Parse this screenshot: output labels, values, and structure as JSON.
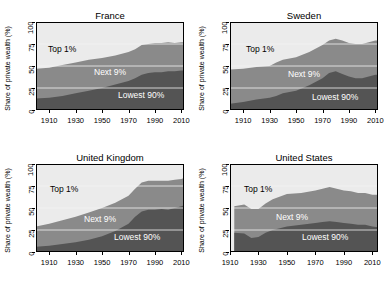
{
  "figure": {
    "ylabel": "Share of private wealth (%)",
    "yticks": [
      0,
      25,
      50,
      75,
      100
    ],
    "xticks": [
      1910,
      1930,
      1950,
      1970,
      1990,
      2010
    ],
    "band_labels": {
      "top": "Top 1%",
      "middle": "Next 9%",
      "bottom": "Lowest 90%"
    },
    "colors": {
      "top_band": "#ebebeb",
      "middle_band": "#8a8a8a",
      "bottom_band": "#545454",
      "gridline": "#f2f2f2",
      "axis": "#000000"
    }
  },
  "chart_data": [
    {
      "type": "area",
      "title": "France",
      "xlabel": "",
      "ylabel": "Share of private wealth (%)",
      "xlim": [
        1900,
        2012
      ],
      "ylim": [
        0,
        100
      ],
      "grid": true,
      "stacked": true,
      "legend_position": "inline-annotations",
      "x": [
        1900,
        1910,
        1920,
        1930,
        1940,
        1950,
        1960,
        1970,
        1975,
        1980,
        1985,
        1990,
        1995,
        2000,
        2005,
        2010,
        2012
      ],
      "series": [
        {
          "name": "Lowest 90%",
          "values": [
            13,
            14,
            16,
            19,
            22,
            25,
            29,
            33,
            36,
            40,
            42,
            43,
            43,
            44,
            44,
            45,
            45
          ]
        },
        {
          "name": "Next 9%",
          "values": [
            34,
            34,
            35,
            35,
            35,
            34,
            33,
            33,
            33,
            34,
            33,
            33,
            33,
            33,
            32,
            32,
            32
          ]
        },
        {
          "name": "Top 1%",
          "values": [
            53,
            52,
            49,
            46,
            43,
            41,
            38,
            34,
            31,
            26,
            25,
            24,
            24,
            23,
            24,
            23,
            23
          ]
        }
      ],
      "cumulative_bottom": [
        13,
        14,
        16,
        19,
        22,
        25,
        29,
        33,
        36,
        40,
        42,
        43,
        43,
        44,
        44,
        45,
        45
      ],
      "cumulative_middle": [
        47,
        48,
        51,
        54,
        57,
        59,
        62,
        66,
        69,
        74,
        75,
        76,
        76,
        77,
        76,
        77,
        77
      ]
    },
    {
      "type": "area",
      "title": "Sweden",
      "xlabel": "",
      "ylabel": "Share of private wealth (%)",
      "xlim": [
        1900,
        2012
      ],
      "ylim": [
        0,
        100
      ],
      "grid": true,
      "stacked": true,
      "legend_position": "inline-annotations",
      "x": [
        1900,
        1910,
        1920,
        1930,
        1935,
        1940,
        1950,
        1960,
        1970,
        1975,
        1980,
        1985,
        1990,
        1995,
        2000,
        2005,
        2010,
        2012
      ],
      "series": [
        {
          "name": "Lowest 90%",
          "values": [
            7,
            9,
            12,
            14,
            16,
            19,
            22,
            28,
            36,
            42,
            44,
            41,
            38,
            36,
            36,
            38,
            40,
            40
          ]
        },
        {
          "name": "Next 9%",
          "values": [
            39,
            38,
            37,
            36,
            38,
            38,
            38,
            38,
            38,
            37,
            37,
            38,
            38,
            39,
            39,
            39,
            39,
            39
          ]
        },
        {
          "name": "Top 1%",
          "values": [
            54,
            53,
            51,
            50,
            46,
            43,
            40,
            34,
            26,
            21,
            19,
            21,
            24,
            25,
            25,
            23,
            21,
            21
          ]
        }
      ],
      "cumulative_bottom": [
        7,
        9,
        12,
        14,
        16,
        19,
        22,
        28,
        36,
        42,
        44,
        41,
        38,
        36,
        36,
        38,
        40,
        40
      ],
      "cumulative_middle": [
        46,
        47,
        49,
        50,
        54,
        57,
        60,
        66,
        74,
        79,
        81,
        79,
        76,
        75,
        75,
        77,
        79,
        79
      ]
    },
    {
      "type": "area",
      "title": "United Kingdom",
      "xlabel": "",
      "ylabel": "Share of private wealth (%)",
      "xlim": [
        1900,
        2012
      ],
      "ylim": [
        0,
        100
      ],
      "grid": true,
      "stacked": true,
      "legend_position": "inline-annotations",
      "x": [
        1900,
        1910,
        1920,
        1930,
        1940,
        1950,
        1960,
        1970,
        1975,
        1980,
        1985,
        1990,
        1995,
        2000,
        2005,
        2010,
        2012
      ],
      "series": [
        {
          "name": "Lowest 90%",
          "values": [
            6,
            7,
            9,
            11,
            14,
            18,
            24,
            32,
            40,
            46,
            48,
            48,
            49,
            48,
            50,
            52,
            53
          ]
        },
        {
          "name": "Next 9%",
          "values": [
            23,
            25,
            27,
            29,
            31,
            32,
            32,
            32,
            32,
            33,
            33,
            33,
            32,
            33,
            32,
            31,
            31
          ]
        },
        {
          "name": "Top 1%",
          "values": [
            71,
            68,
            64,
            60,
            55,
            50,
            44,
            36,
            28,
            21,
            19,
            19,
            19,
            19,
            18,
            17,
            16
          ]
        }
      ],
      "cumulative_bottom": [
        6,
        7,
        9,
        11,
        14,
        18,
        24,
        32,
        40,
        46,
        48,
        48,
        49,
        48,
        50,
        52,
        53
      ],
      "cumulative_middle": [
        29,
        32,
        36,
        40,
        45,
        50,
        56,
        64,
        72,
        79,
        81,
        81,
        81,
        81,
        82,
        83,
        84
      ]
    },
    {
      "type": "area",
      "title": "United States",
      "xlabel": "",
      "ylabel": "Share of private wealth (%)",
      "xlim": [
        1910,
        2014
      ],
      "ylim": [
        0,
        100
      ],
      "grid": true,
      "stacked": true,
      "legend_position": "inline-annotations",
      "x": [
        1913,
        1920,
        1925,
        1930,
        1935,
        1940,
        1950,
        1960,
        1970,
        1975,
        1980,
        1985,
        1990,
        1995,
        2000,
        2005,
        2010,
        2014
      ],
      "series": [
        {
          "name": "Lowest 90%",
          "values": [
            22,
            21,
            16,
            17,
            22,
            25,
            29,
            31,
            33,
            34,
            35,
            34,
            33,
            32,
            31,
            31,
            29,
            28
          ]
        },
        {
          "name": "Next 9%",
          "values": [
            30,
            33,
            33,
            32,
            33,
            35,
            37,
            36,
            37,
            38,
            39,
            38,
            37,
            37,
            36,
            36,
            36,
            37
          ]
        },
        {
          "name": "Top 1%",
          "values": [
            48,
            46,
            51,
            51,
            45,
            40,
            34,
            33,
            30,
            28,
            26,
            28,
            30,
            31,
            33,
            33,
            35,
            35
          ]
        }
      ],
      "cumulative_bottom": [
        22,
        21,
        16,
        17,
        22,
        25,
        29,
        31,
        33,
        34,
        35,
        34,
        33,
        32,
        31,
        31,
        29,
        28
      ],
      "cumulative_middle": [
        52,
        54,
        49,
        49,
        55,
        60,
        66,
        67,
        70,
        72,
        74,
        72,
        70,
        69,
        67,
        67,
        65,
        65
      ]
    }
  ]
}
